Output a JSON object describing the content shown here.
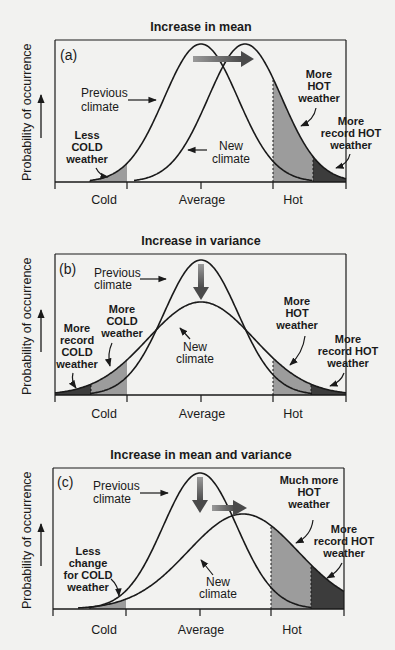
{
  "chart_data": [
    {
      "type": "line",
      "panel": "(a)",
      "title": "Increase in mean",
      "ylabel": "Probability of occurrence",
      "xticks": [
        "Cold",
        "Average",
        "Hot"
      ],
      "series": [
        {
          "name": "Previous climate",
          "mean": 0,
          "sd": 1
        },
        {
          "name": "New climate",
          "mean": 0.6,
          "sd": 1
        }
      ],
      "annotations": [
        {
          "text": "Previous climate",
          "role": "curve-label"
        },
        {
          "text": "New climate",
          "role": "curve-label"
        },
        {
          "text": "Less COLD weather",
          "role": "region-label"
        },
        {
          "text": "More HOT weather",
          "role": "region-label"
        },
        {
          "text": "More record HOT weather",
          "role": "region-label"
        }
      ]
    },
    {
      "type": "line",
      "panel": "(b)",
      "title": "Increase in variance",
      "ylabel": "Probability of occurrence",
      "xticks": [
        "Cold",
        "Average",
        "Hot"
      ],
      "series": [
        {
          "name": "Previous climate",
          "mean": 0,
          "sd": 1
        },
        {
          "name": "New climate",
          "mean": 0,
          "sd": 1.45
        }
      ],
      "annotations": [
        {
          "text": "Previous climate",
          "role": "curve-label"
        },
        {
          "text": "New climate",
          "role": "curve-label"
        },
        {
          "text": "More record COLD weather",
          "role": "region-label"
        },
        {
          "text": "More COLD weather",
          "role": "region-label"
        },
        {
          "text": "More HOT weather",
          "role": "region-label"
        },
        {
          "text": "More record HOT weather",
          "role": "region-label"
        }
      ]
    },
    {
      "type": "line",
      "panel": "(c)",
      "title": "Increase in mean and variance",
      "ylabel": "Probability of occurrence",
      "xticks": [
        "Cold",
        "Average",
        "Hot"
      ],
      "series": [
        {
          "name": "Previous climate",
          "mean": 0,
          "sd": 1
        },
        {
          "name": "New climate",
          "mean": 0.6,
          "sd": 1.55
        }
      ],
      "annotations": [
        {
          "text": "Previous climate",
          "role": "curve-label"
        },
        {
          "text": "New climate",
          "role": "curve-label"
        },
        {
          "text": "Less change for COLD weather",
          "role": "region-label"
        },
        {
          "text": "Much more HOT weather",
          "role": "region-label"
        },
        {
          "text": "More record HOT weather",
          "role": "region-label"
        }
      ]
    }
  ],
  "colors": {
    "background": "#f2f2f0",
    "curve": "#1a1a1a",
    "shade_light": "#9c9c9c",
    "shade_dark": "#3c3c3c",
    "arrow_start": "#8a8a8a",
    "arrow_end": "#4a4a4a"
  },
  "panels": [
    {
      "id": "a",
      "title": "Increase in mean",
      "label": "(a)",
      "ylabel": "Probability of occurrence",
      "ticks": {
        "cold": "Cold",
        "average": "Average",
        "hot": "Hot"
      },
      "frame": {
        "left": 55,
        "top": 40,
        "right": 346,
        "base": 182
      },
      "xticks": {
        "cold": 127,
        "avg": 201,
        "hot": 273
      },
      "prev": {
        "mu": 201,
        "sigma": 37,
        "peak": 44
      },
      "next": {
        "mu": 245,
        "sigma": 37,
        "peak": 44
      },
      "shades": [
        {
          "curve": "prev",
          "from": 90,
          "to": 127,
          "tone": "light"
        },
        {
          "curve": "next",
          "from": 273,
          "to": 313,
          "tone": "light"
        },
        {
          "curve": "next",
          "from": 313,
          "to": 346,
          "tone": "dark"
        }
      ],
      "labels": {
        "prev1": "Previous",
        "prev2": "climate",
        "new1": "New",
        "new2": "climate",
        "cold1": "Less",
        "cold2": "COLD",
        "cold3": "weather",
        "hot1": "More",
        "hot2": "HOT",
        "hot3": "weather",
        "rec1": "More",
        "rec2": "record HOT",
        "rec3": "weather"
      }
    },
    {
      "id": "b",
      "title": "Increase in variance",
      "label": "(b)",
      "ylabel": "Probability of occurrence",
      "ticks": {
        "cold": "Cold",
        "average": "Average",
        "hot": "Hot"
      },
      "frame": {
        "left": 55,
        "top": 254,
        "right": 346,
        "base": 395
      },
      "xticks": {
        "cold": 127,
        "avg": 201,
        "hot": 273
      },
      "prev": {
        "mu": 201,
        "sigma": 37,
        "peak": 260
      },
      "next": {
        "mu": 201,
        "sigma": 53,
        "peak": 302
      },
      "shades": [
        {
          "curve": "next",
          "from": 55,
          "to": 91,
          "tone": "dark"
        },
        {
          "curve": "next",
          "from": 91,
          "to": 127,
          "tone": "light"
        },
        {
          "curve": "next",
          "from": 273,
          "to": 311,
          "tone": "light"
        },
        {
          "curve": "next",
          "from": 311,
          "to": 346,
          "tone": "dark"
        }
      ],
      "labels": {
        "prev1": "Previous",
        "prev2": "climate",
        "new1": "New",
        "new2": "climate",
        "rc1": "More",
        "rc2": "record",
        "rc3": "COLD",
        "rc4": "weather",
        "mc1": "More",
        "mc2": "COLD",
        "mc3": "weather",
        "hot1": "More",
        "hot2": "HOT",
        "hot3": "weather",
        "rec1": "More",
        "rec2": "record HOT",
        "rec3": "weather"
      }
    },
    {
      "id": "c",
      "title": "Increase in mean and variance",
      "label": "(c)",
      "ylabel": "Probability of occurrence",
      "ticks": {
        "cold": "Cold",
        "average": "Average",
        "hot": "Hot"
      },
      "frame": {
        "left": 53,
        "top": 468,
        "right": 344,
        "base": 609
      },
      "xticks": {
        "cold": 126,
        "avg": 200,
        "hot": 271
      },
      "prev": {
        "mu": 200,
        "sigma": 37,
        "peak": 473
      },
      "next": {
        "mu": 243,
        "sigma": 55,
        "peak": 514
      },
      "shades": [
        {
          "curve": "next",
          "from": 90,
          "to": 126,
          "tone": "light"
        },
        {
          "curve": "next",
          "from": 271,
          "to": 311,
          "tone": "light"
        },
        {
          "curve": "next",
          "from": 311,
          "to": 344,
          "tone": "dark"
        }
      ],
      "labels": {
        "prev1": "Previous",
        "prev2": "climate",
        "new1": "New",
        "new2": "climate",
        "cold1": "Less",
        "cold2": "change",
        "cold3": "for COLD",
        "cold4": "weather",
        "hot1": "Much more",
        "hot2": "HOT",
        "hot3": "weather",
        "rec1": "More",
        "rec2": "record HOT",
        "rec3": "weather"
      }
    }
  ]
}
